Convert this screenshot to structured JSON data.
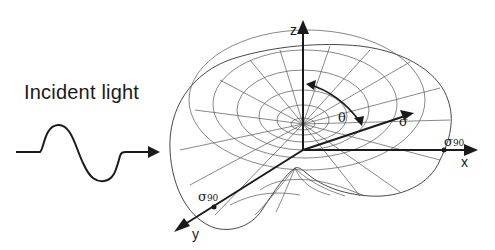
{
  "diagram": {
    "incident_label": "Incident light",
    "axes": {
      "x": "x",
      "y": "y",
      "z": "z"
    },
    "angle_label": "θ",
    "sigma_label": "σ",
    "sigma90_symbol": "σ",
    "sigma90_subscript": "90",
    "colors": {
      "lines": "#1a1a1a",
      "mesh": "#555555",
      "background": "#ffffff"
    }
  }
}
